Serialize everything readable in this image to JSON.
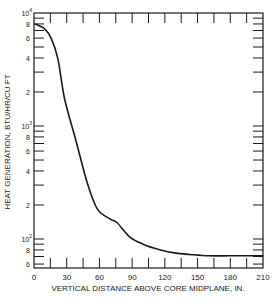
{
  "chart_data": {
    "type": "line",
    "title": "",
    "xlabel": "VERTICAL DISTANCE ABOVE CORE MIDPLANE, IN.",
    "ylabel": "HEAT GENERATION, BTU/HR/CU FT",
    "xlim": [
      0,
      210
    ],
    "ylim": [
      55,
      10000
    ],
    "yscale": "log",
    "grid": false,
    "legend": null,
    "x_ticks": [
      0,
      30,
      60,
      90,
      120,
      150,
      180,
      210
    ],
    "x_tick_labels": [
      "0",
      "30",
      "60",
      "90",
      "120",
      "150",
      "180",
      "210"
    ],
    "y_tick_labels": [
      {
        "value": 10000,
        "label": "10^4"
      },
      {
        "value": 8000,
        "label": "8"
      },
      {
        "value": 6000,
        "label": "6"
      },
      {
        "value": 4000,
        "label": "4"
      },
      {
        "value": 2000,
        "label": "2"
      },
      {
        "value": 1000,
        "label": "10^3"
      },
      {
        "value": 800,
        "label": "8"
      },
      {
        "value": 600,
        "label": "6"
      },
      {
        "value": 400,
        "label": "4"
      },
      {
        "value": 200,
        "label": "2"
      },
      {
        "value": 100,
        "label": "10^2"
      },
      {
        "value": 80,
        "label": "8"
      },
      {
        "value": 60,
        "label": "6"
      }
    ],
    "series": [
      {
        "name": "Heat generation",
        "x": [
          0,
          10,
          16,
          22,
          28,
          38,
          49,
          58,
          70,
          76,
          88,
          100,
          116,
          130,
          143,
          160,
          180,
          210
        ],
        "values": [
          8000,
          7200,
          5900,
          3900,
          1750,
          770,
          310,
          185,
          150,
          140,
          104,
          90,
          80,
          75,
          73,
          71,
          71,
          71
        ]
      }
    ]
  }
}
